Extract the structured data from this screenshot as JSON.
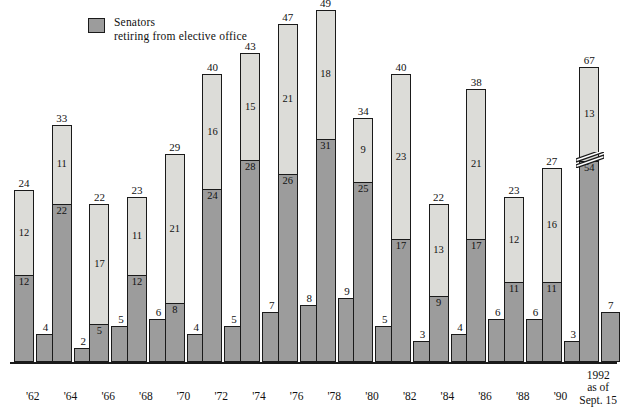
{
  "legend": {
    "label": "Senators\nretiring from elective office",
    "swatch_color": "#9c9c9c",
    "icon": "legend-swatch-icon"
  },
  "colors": {
    "light_segment": "#dcdcd8",
    "dark_segment": "#9c9c9c",
    "outline": "#1a1a1a",
    "background": "#ffffff"
  },
  "axis": {
    "break_marker": "axis-break-zigzag",
    "break_on_category": "1992"
  },
  "chart_data": {
    "type": "bar",
    "title": "",
    "subtitle": "",
    "xlabel": "",
    "ylabel": "",
    "grid": false,
    "legend_position": "top-left",
    "stacked": true,
    "note": "Each year shows a stacked total bar (light top segment + dark bottom segment) plus a separate small dark bar to its right.",
    "categories": [
      "'62",
      "'64",
      "'66",
      "'68",
      "'70",
      "'72",
      "'74",
      "'76",
      "'78",
      "'80",
      "'82",
      "'84",
      "'86",
      "'88",
      "'90",
      "1992\nas of\nSept. 15"
    ],
    "series": [
      {
        "name": "total",
        "values": [
          24,
          33,
          22,
          23,
          29,
          40,
          43,
          47,
          49,
          34,
          40,
          22,
          38,
          23,
          27,
          67
        ]
      },
      {
        "name": "light-segment",
        "values": [
          12,
          11,
          17,
          11,
          21,
          16,
          15,
          21,
          18,
          9,
          23,
          13,
          21,
          12,
          16,
          13
        ]
      },
      {
        "name": "dark-segment-senators-retiring-from-elective-office",
        "values": [
          12,
          22,
          5,
          12,
          8,
          24,
          28,
          26,
          31,
          25,
          17,
          9,
          17,
          11,
          11,
          54
        ]
      },
      {
        "name": "side-bar",
        "values": [
          4,
          2,
          5,
          6,
          4,
          5,
          7,
          8,
          9,
          5,
          3,
          4,
          6,
          6,
          3,
          7
        ]
      }
    ],
    "ylim": [
      0,
      67
    ]
  }
}
